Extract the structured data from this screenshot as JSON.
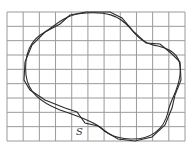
{
  "figure": {
    "type": "area-estimation-grid",
    "grid": {
      "columns": 11,
      "rows": 9,
      "left": 7,
      "top": 12,
      "right": 185,
      "bottom": 141,
      "line_color": "#9a9a9a"
    },
    "curves": [
      {
        "name": "smooth-boundary",
        "style": "smooth"
      },
      {
        "name": "polygonal-boundary",
        "style": "approximate"
      }
    ],
    "label": {
      "text": "S",
      "x": 78,
      "y": 134
    }
  }
}
